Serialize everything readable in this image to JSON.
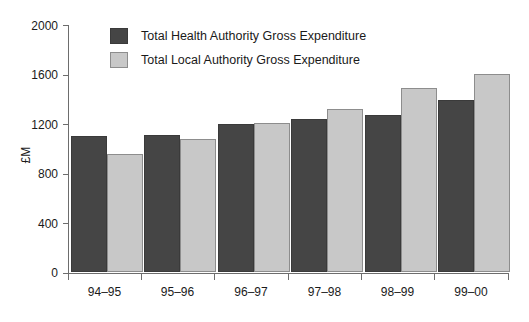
{
  "chart_data": {
    "type": "bar",
    "title": "",
    "xlabel": "",
    "ylabel": "£M",
    "ylim": [
      0,
      2000
    ],
    "ytick_step": 400,
    "yticks": [
      "0",
      "400",
      "800",
      "1200",
      "1600",
      "2000"
    ],
    "grid": false,
    "legend_position": "top-left-inside",
    "categories": [
      "94–95",
      "95–96",
      "96–97",
      "97–98",
      "98–99",
      "99–00"
    ],
    "series": [
      {
        "name": "Total Health Authority Gross Expenditure",
        "color": "#454545",
        "values": [
          1100,
          1105,
          1190,
          1235,
          1270,
          1385
        ]
      },
      {
        "name": "Total Local Authority Gross Expenditure",
        "color": "#c8c8c8",
        "values": [
          955,
          1075,
          1200,
          1315,
          1480,
          1595
        ]
      }
    ]
  },
  "axis": {
    "y_title": "£M",
    "y_tick_labels": [
      "2000",
      "1600",
      "1200",
      "800",
      "400",
      "0"
    ],
    "x_tick_labels": [
      "94–95",
      "95–96",
      "96–97",
      "97–98",
      "98–99",
      "99–00"
    ]
  },
  "legend": {
    "items": [
      {
        "label": "Total Health Authority Gross Expenditure",
        "swatch": "dark"
      },
      {
        "label": "Total Local Authority Gross Expenditure",
        "swatch": "light"
      }
    ]
  }
}
